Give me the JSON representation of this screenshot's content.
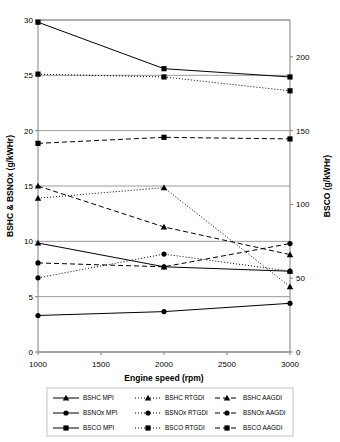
{
  "chart_data": {
    "type": "line",
    "title": "",
    "xlabel": "Engine speed (rpm)",
    "ylabel": "BSHC & BSNOx (g/kWHr)",
    "y2label": "BSCO (g/kWHr)",
    "x": [
      1000,
      2000,
      3000
    ],
    "xlim": [
      1000,
      3000
    ],
    "xticks": [
      1000,
      1500,
      2000,
      2500,
      3000
    ],
    "xtick_labels": [
      "1000",
      "1500",
      "2000",
      "2500",
      "3000"
    ],
    "ylim": [
      0,
      30
    ],
    "yticks": [
      0,
      5,
      10,
      15,
      20,
      25,
      30
    ],
    "ytick_labels": [
      "0",
      "5",
      "10",
      "15",
      "20",
      "25",
      "30"
    ],
    "y2lim": [
      0,
      225
    ],
    "y2ticks": [
      0,
      50,
      100,
      150,
      200
    ],
    "y2tick_labels": [
      "0",
      "50",
      "100",
      "150",
      "200"
    ],
    "grid": true,
    "legend_position": "bottom",
    "series": [
      {
        "name": "BSHC MPI",
        "axis": "left",
        "marker": "triangle",
        "dash": "solid",
        "values": [
          9.85,
          7.7,
          7.3
        ]
      },
      {
        "name": "BSHC RTGDI",
        "axis": "left",
        "marker": "triangle",
        "dash": "dotted",
        "values": [
          13.9,
          14.85,
          5.9
        ]
      },
      {
        "name": "BSHC AAGDI",
        "axis": "left",
        "marker": "triangle",
        "dash": "dashed",
        "values": [
          15.0,
          11.3,
          8.8
        ]
      },
      {
        "name": "BSNOx MPI",
        "axis": "left",
        "marker": "circle",
        "dash": "solid",
        "values": [
          3.3,
          3.65,
          4.4
        ]
      },
      {
        "name": "BSNOx RTGDI",
        "axis": "left",
        "marker": "circle",
        "dash": "dotted",
        "values": [
          6.7,
          8.85,
          7.3
        ]
      },
      {
        "name": "BSNOx AAGDI",
        "axis": "left",
        "marker": "circle",
        "dash": "dashed",
        "values": [
          8.05,
          7.7,
          9.8
        ]
      },
      {
        "name": "BSCO MPI",
        "axis": "right",
        "marker": "square",
        "dash": "solid",
        "values": [
          223.5,
          192.0,
          186.4
        ]
      },
      {
        "name": "BSCO RTGDI",
        "axis": "right",
        "marker": "square",
        "dash": "dotted",
        "values": [
          188.3,
          186.4,
          177.0
        ]
      },
      {
        "name": "BSCO AAGDI",
        "axis": "right",
        "marker": "square",
        "dash": "dashed",
        "values": [
          141.4,
          145.5,
          144.4
        ]
      }
    ]
  },
  "legend": {
    "rows": [
      [
        {
          "label": "BSHC MPI"
        },
        {
          "label": "BSHC RTGDI"
        },
        {
          "label": "BSHC AAGDI"
        }
      ],
      [
        {
          "label": "BSNOx MPI"
        },
        {
          "label": "BSNOx RTGDI"
        },
        {
          "label": "BSNOx AAGDI"
        }
      ],
      [
        {
          "label": "BSCO MPI"
        },
        {
          "label": "BSCO RTGDI"
        },
        {
          "label": "BSCO AAGDI"
        }
      ]
    ]
  },
  "colors": {
    "line": "#000000",
    "grid": "#808080",
    "axis": "#808080",
    "text": "#000000",
    "background": "#ffffff"
  }
}
